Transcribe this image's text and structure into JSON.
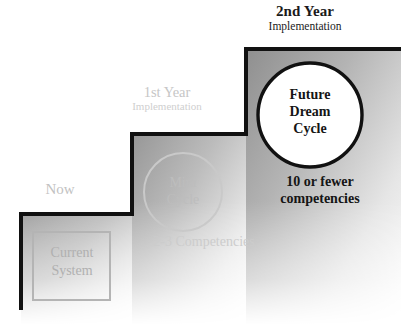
{
  "diagram": {
    "title_implied": "Staircase implementation roadmap",
    "steps": [
      {
        "id": "now",
        "label": "Now",
        "box_label_line1": "Current",
        "box_label_line2": "System",
        "tone": "faded"
      },
      {
        "id": "first-year",
        "label_head": "1st Year",
        "label_sub": "Implementation",
        "circle_line1": "Mini",
        "circle_line2": "Cycle",
        "caption": "2-3 Competencies",
        "tone": "faded"
      },
      {
        "id": "second-year",
        "label_head": "2nd Year",
        "label_sub": "Implementation",
        "circle_line1": "Future",
        "circle_line2": "Dream",
        "circle_line3": "Cycle",
        "caption_line1": "10 or fewer",
        "caption_line2": "competencies",
        "tone": "solid"
      }
    ],
    "colors": {
      "stroke": "#111111",
      "step_shade_dark": "#9a9a9a",
      "step_shade_light": "#ffffff",
      "ghost_text": "#c6c6c6",
      "ghost_shape": "#c9c9c9",
      "solid_text": "#151515",
      "background": "#ffffff"
    }
  }
}
